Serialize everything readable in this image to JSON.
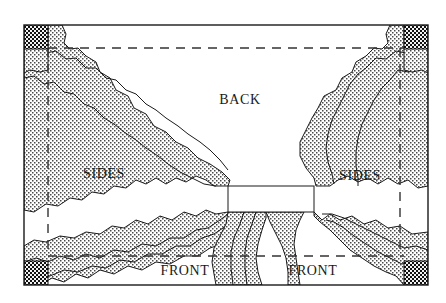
{
  "figure": {
    "background_color": "#ffffff",
    "outline_color": "#1a1a1a",
    "stipple_color": "#3a3a3a",
    "dark_corner_color": "#111111",
    "dashed_color": "#333333"
  },
  "labels": {
    "back": "BACK",
    "sides_left": "SIDES",
    "sides_right": "SIDES",
    "front_left": "FRONT",
    "front_right": "FRONT"
  },
  "label_positions": {
    "back": {
      "x": 240,
      "y": 101
    },
    "sides_left": {
      "x": 104,
      "y": 175
    },
    "sides_right": {
      "x": 360,
      "y": 177
    },
    "front_left": {
      "x": 185,
      "y": 272
    },
    "front_right": {
      "x": 313,
      "y": 272
    }
  },
  "frame": {
    "outer": {
      "x": 24,
      "y": 25,
      "width": 404,
      "height": 260
    },
    "dashed_inset": {
      "left": 48,
      "top": 48,
      "right": 400,
      "bottom": 256
    }
  },
  "corner_blocks": [
    {
      "name": "top-left",
      "x": 24,
      "y": 25,
      "width": 24,
      "height": 24
    },
    {
      "name": "top-right",
      "x": 404,
      "y": 25,
      "width": 24,
      "height": 24
    },
    {
      "name": "bottom-left",
      "x": 24,
      "y": 261,
      "width": 24,
      "height": 24
    },
    {
      "name": "bottom-right",
      "x": 404,
      "y": 261,
      "width": 24,
      "height": 24
    }
  ],
  "center_void": {
    "x": 228,
    "y": 186,
    "width": 86,
    "height": 26
  }
}
